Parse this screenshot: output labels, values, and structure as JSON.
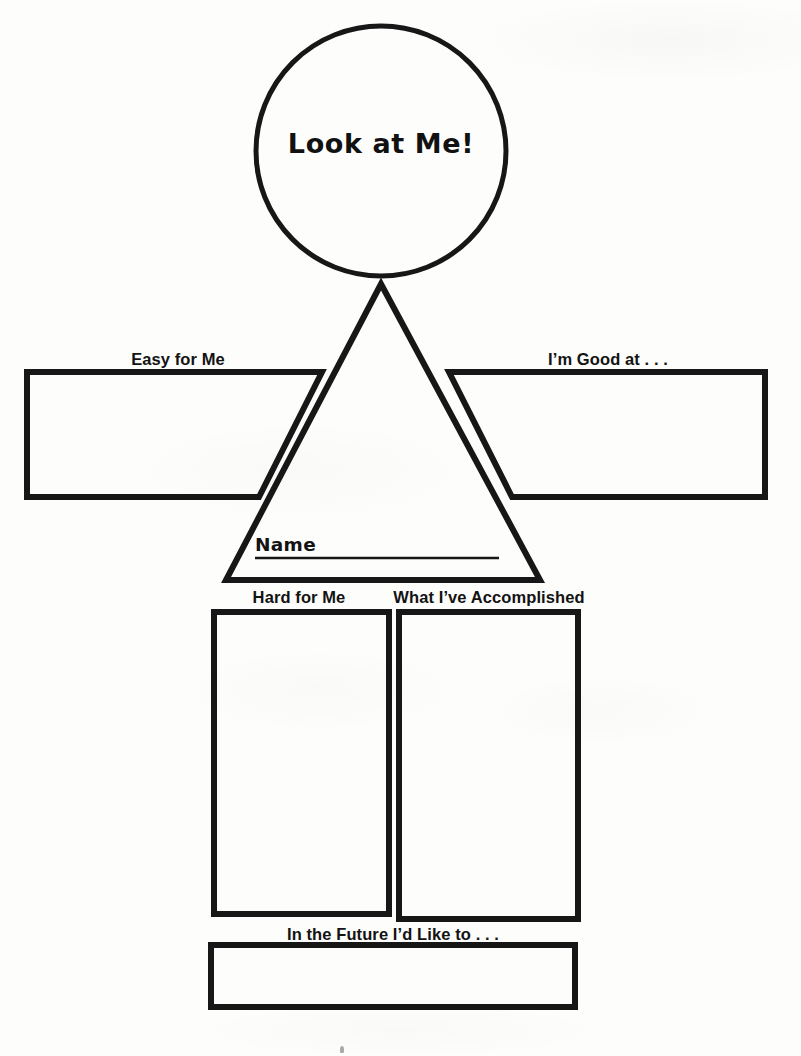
{
  "page": {
    "kind": "printable-worksheet",
    "title": "Look at Me!",
    "background_color": "#fdfdfc",
    "ink_color": "#171717",
    "width": 801,
    "height": 1056
  },
  "head": {
    "shape": "circle",
    "title": "Look at Me!"
  },
  "body": {
    "shape": "triangle",
    "name_label": "Name",
    "name_value": ""
  },
  "arms": {
    "left": {
      "label": "Easy for Me",
      "value": ""
    },
    "right": {
      "label": "I’m Good at . . .",
      "value": ""
    }
  },
  "legs": {
    "left": {
      "label": "Hard for Me",
      "value": ""
    },
    "right": {
      "label": "What I’ve Accomplished",
      "value": ""
    }
  },
  "footer": {
    "label": "In the Future I’d Like to . . .",
    "value": ""
  }
}
